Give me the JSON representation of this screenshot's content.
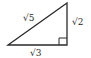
{
  "diagram": {
    "type": "right-triangle",
    "vertices": {
      "top": [
        67,
        3
      ],
      "bottom_right": [
        67,
        45
      ],
      "bottom_left": [
        8,
        45
      ]
    },
    "labels": {
      "hypotenuse": "√5",
      "vertical_leg": "√2",
      "base": "√3"
    },
    "right_angle_marker": true,
    "stroke_color": "#2a2a2a"
  }
}
